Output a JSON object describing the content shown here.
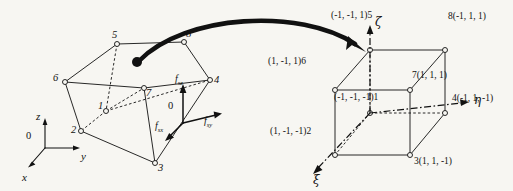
{
  "figure": {
    "background_color": "#f7f6f2",
    "stroke_color": "#111111"
  },
  "physical_element": {
    "caption": "distorted 8-node hexahedral element in global x-y-z space",
    "nodes": [
      {
        "id": "1",
        "label": "1",
        "x": 101,
        "y": 108
      },
      {
        "id": "2",
        "label": "2",
        "x": 76,
        "y": 134
      },
      {
        "id": "3",
        "label": "3",
        "x": 160,
        "y": 165
      },
      {
        "id": "4",
        "label": "4",
        "x": 210,
        "y": 83
      },
      {
        "id": "5",
        "label": "5",
        "x": 113,
        "y": 40
      },
      {
        "id": "6",
        "label": "6",
        "x": 59,
        "y": 79
      },
      {
        "id": "7",
        "label": "7",
        "x": 139,
        "y": 88
      },
      {
        "id": "8",
        "label": "8",
        "x": 187,
        "y": 43
      }
    ],
    "global_axes": {
      "origin_label": "0",
      "z_label": "z",
      "y_label": "y",
      "x_label": "x"
    },
    "force_frame": {
      "origin_label": "0",
      "vertical_label": "f",
      "vertical_sub": "sz",
      "horizontal_label": "f",
      "horizontal_sub": "sy",
      "diagonal_label": "f",
      "diagonal_sub": "sx"
    }
  },
  "mapping_arrow": {
    "name": "mapping-arrow",
    "description": "thick curved arrow from physical element to reference cube"
  },
  "reference_cube": {
    "caption": "parent reference cube in natural coordinates xi-eta-zeta",
    "natural_axes": {
      "zeta_label": "ζ",
      "eta_label": "η",
      "xi_label": "ξ"
    },
    "nodes": [
      {
        "id": "1",
        "text": "(-1, -1, -1)1",
        "x": 334,
        "y": 93
      },
      {
        "id": "2",
        "text": "(1, -1, -1)2",
        "x": 270,
        "y": 127
      },
      {
        "id": "3",
        "text": "3(1, 1, -1)",
        "x": 414,
        "y": 155
      },
      {
        "id": "4",
        "text": "4(-1, 1, -1)",
        "x": 456,
        "y": 92
      },
      {
        "id": "5",
        "text": "(-1, -1, 1)5",
        "x": 331,
        "y": 11
      },
      {
        "id": "6",
        "text": "(1, -1, 1)6",
        "x": 268,
        "y": 57
      },
      {
        "id": "7",
        "text": "7(1, 1, 1)",
        "x": 420,
        "y": 69
      },
      {
        "id": "8",
        "text": "8(-1, 1, 1)",
        "x": 450,
        "y": 12
      }
    ]
  }
}
